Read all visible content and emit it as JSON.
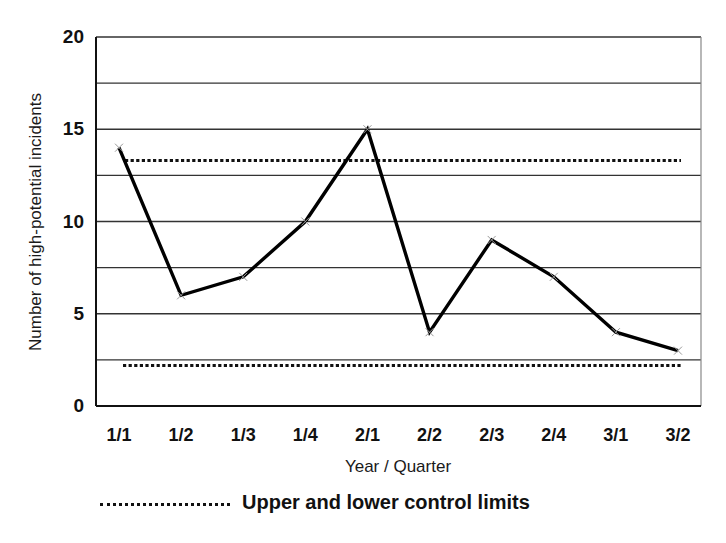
{
  "chart_data": {
    "type": "line",
    "title": "",
    "xlabel": "Year / Quarter",
    "ylabel": "Number of high-potential incidents",
    "categories": [
      "1/1",
      "1/2",
      "1/3",
      "1/4",
      "2/1",
      "2/2",
      "2/3",
      "2/4",
      "3/1",
      "3/2"
    ],
    "series": [
      {
        "name": "High-potential incidents",
        "values": [
          14,
          6,
          7,
          10,
          15,
          4,
          9,
          7,
          4,
          3
        ],
        "color": "#000000",
        "marker": "x"
      },
      {
        "name": "Upper control limit",
        "values": [
          13.3,
          13.3,
          13.3,
          13.3,
          13.3,
          13.3,
          13.3,
          13.3,
          13.3,
          13.3
        ],
        "style": "dotted",
        "color": "#000000"
      },
      {
        "name": "Lower control limit",
        "values": [
          2.2,
          2.2,
          2.2,
          2.2,
          2.2,
          2.2,
          2.2,
          2.2,
          2.2,
          2.2
        ],
        "style": "dotted",
        "color": "#000000"
      }
    ],
    "ylim": [
      0,
      20
    ],
    "yticks": [
      0,
      5,
      10,
      15,
      20
    ],
    "ygrid_step": 2.5,
    "grid": true,
    "legend": {
      "position": "bottom",
      "entries": [
        "Upper and lower control limits"
      ]
    }
  },
  "labels": {
    "ylabel": "Number of high-potential incidents",
    "xlabel": "Year / Quarter",
    "legend": "Upper and lower control limits",
    "yticks": [
      "0",
      "5",
      "10",
      "15",
      "20"
    ],
    "xticks": [
      "1/1",
      "1/2",
      "1/3",
      "1/4",
      "2/1",
      "2/2",
      "2/3",
      "2/4",
      "3/1",
      "3/2"
    ]
  }
}
